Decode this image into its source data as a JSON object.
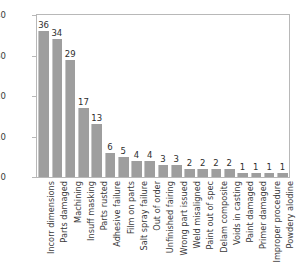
{
  "chart_data": {
    "type": "bar",
    "title": "",
    "subtitle": "",
    "xlabel": "",
    "ylabel": "",
    "ylim": [
      0,
      40
    ],
    "yticks": [
      0,
      10,
      20,
      30,
      40
    ],
    "ytick_labels": [
      "0",
      "10",
      "20",
      "30",
      "40"
    ],
    "grid": false,
    "legend": false,
    "legend_position": "none",
    "bar_color": "#9e9e9e",
    "frame_color": "#b8b8b8",
    "background": "#ffffff",
    "value_labels_shown": true,
    "xtick_rotation": -90,
    "categories": [
      "Incorr dimensions",
      "Parts damaged",
      "Machining",
      "Insuff masking",
      "Parts rusted",
      "Adhesive failure",
      "Film on parts",
      "Salt spray failure",
      "Out of order",
      "Unfinished fairing",
      "Wrong part issued",
      "Weld misaligned",
      "Paint out of spec",
      "Delam composite",
      "Voids in casting",
      "Paint damaged",
      "Primer damaged",
      "Improper procedure",
      "Powdery alodine"
    ],
    "values": [
      36,
      34,
      29,
      17,
      13,
      6,
      5,
      4,
      4,
      3,
      3,
      2,
      2,
      2,
      2,
      1,
      1,
      1,
      1
    ],
    "value_label_texts": [
      "36",
      "34",
      "29",
      "17",
      "13",
      "6",
      "5",
      "4",
      "4",
      "3",
      "3",
      "2",
      "2",
      "2",
      "2",
      "1",
      "1",
      "1",
      "1"
    ]
  }
}
